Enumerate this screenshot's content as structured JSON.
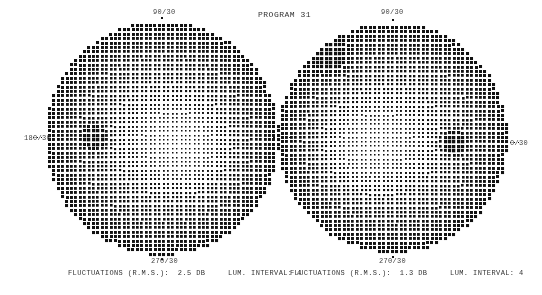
{
  "title": "PROGRAM 31",
  "fields": [
    {
      "eye": "left",
      "center": [
        162,
        138
      ],
      "radius": 117,
      "labels": {
        "top": "90/30",
        "bottom": "270/30",
        "left": "180/30"
      },
      "blind_spot": [
        95,
        137
      ],
      "footer": {
        "fluctuations_label": "FLUCTUATIONS (R.M.S.):",
        "fluctuations_value": "2.5 DB",
        "lum_interval_label": "LUM. INTERVAL:",
        "lum_interval_value": "4"
      }
    },
    {
      "eye": "right",
      "center": [
        393,
        138
      ],
      "radius": 115,
      "labels": {
        "top": "90/30",
        "bottom": "270/30",
        "right": "0/30"
      },
      "blind_spot": [
        453,
        142
      ],
      "footer": {
        "fluctuations_label": "FLUCTUATIONS (R.M.S.):",
        "fluctuations_value": "1.3 DB",
        "lum_interval_label": "LUM. INTERVAL:",
        "lum_interval_value": "4"
      }
    }
  ],
  "dot_spacing": 4.4,
  "ink_color": "#111111"
}
